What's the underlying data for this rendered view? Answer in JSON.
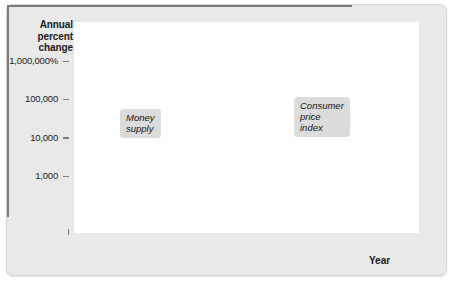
{
  "figure": {
    "background_color": "#e9e9e9",
    "plot_background_color": "#ffffff"
  },
  "axes": {
    "y_title": "Annual\npercent\nchange",
    "x_title": "Year",
    "y_ticks": [
      "1,000,000%",
      "100,000",
      "10,000",
      "1,000"
    ],
    "x_ticks": [
      "2003",
      "2004",
      "2005",
      "2006",
      "2007",
      "2008"
    ],
    "axis_break": "zigzag-break"
  },
  "annotations": {
    "money_supply": "Money\nsupply",
    "cpi": "Consumer\nprice\nindex"
  },
  "chart_data": {
    "type": "line",
    "title": "",
    "xlabel": "Year",
    "ylabel": "Annual percent change",
    "yscale": "log",
    "ylim": [
      200,
      3000000
    ],
    "xlim": [
      2003.0,
      2008.3
    ],
    "grid": false,
    "legend": "annotations-on-plot",
    "y_tick_values": [
      1000000,
      100000,
      10000,
      1000
    ],
    "y_tick_labels": [
      "1,000,000%",
      "100,000",
      "10,000",
      "1,000"
    ],
    "x_tick_values": [
      2003,
      2004,
      2005,
      2006,
      2007,
      2008
    ],
    "series": [
      {
        "name": "Money supply",
        "color": "#a0a0a0",
        "x": [
          2003.0,
          2003.12,
          2003.25,
          2003.38,
          2003.5,
          2003.62,
          2003.75,
          2003.88,
          2004.0,
          2004.1,
          2004.2,
          2004.32,
          2004.42,
          2004.54,
          2004.66,
          2004.78,
          2004.9,
          2005.0,
          2005.1,
          2005.18,
          2005.28,
          2005.38,
          2005.46,
          2005.54,
          2005.64,
          2005.76,
          2005.88,
          2006.0,
          2006.12,
          2006.24,
          2006.36,
          2006.48,
          2006.6,
          2006.72,
          2006.84,
          2006.96,
          2007.08,
          2007.2,
          2007.32,
          2007.44,
          2007.56,
          2007.66,
          2007.76,
          2007.88,
          2008.0,
          2008.12,
          2008.24
        ],
        "y": [
          290,
          350,
          430,
          470,
          490,
          520,
          510,
          540,
          600,
          560,
          540,
          560,
          900,
          760,
          700,
          600,
          450,
          330,
          300,
          430,
          300,
          285,
          295,
          300,
          380,
          430,
          560,
          700,
          900,
          1050,
          1200,
          1250,
          1400,
          2200,
          2600,
          3200,
          4500,
          8000,
          21000,
          26000,
          24000,
          45000,
          90000,
          190000,
          330000,
          520000,
          640000
        ]
      },
      {
        "name": "Consumer price index",
        "color": "#6e6e6e",
        "x": [
          2003.0,
          2003.12,
          2003.25,
          2003.38,
          2003.5,
          2003.62,
          2003.75,
          2003.88,
          2004.0,
          2004.1,
          2004.2,
          2004.32,
          2004.42,
          2004.54,
          2004.66,
          2004.78,
          2004.9,
          2005.0,
          2005.1,
          2005.18,
          2005.28,
          2005.38,
          2005.46,
          2005.54,
          2005.64,
          2005.76,
          2005.88,
          2006.0,
          2006.12,
          2006.24,
          2006.36,
          2006.48,
          2006.6,
          2006.72,
          2006.84,
          2006.96,
          2007.08,
          2007.2,
          2007.32,
          2007.44,
          2007.56,
          2007.66,
          2007.76,
          2007.88,
          2008.0,
          2008.12,
          2008.24
        ],
        "y": [
          250,
          330,
          400,
          440,
          480,
          560,
          540,
          600,
          620,
          640,
          600,
          640,
          700,
          650,
          600,
          480,
          360,
          300,
          285,
          280,
          285,
          300,
          420,
          400,
          470,
          560,
          700,
          800,
          950,
          1050,
          1200,
          1100,
          1000,
          1100,
          1300,
          1700,
          2400,
          3600,
          5200,
          7000,
          8000,
          16000,
          40000,
          100000,
          260000,
          480000,
          700000
        ]
      }
    ]
  }
}
